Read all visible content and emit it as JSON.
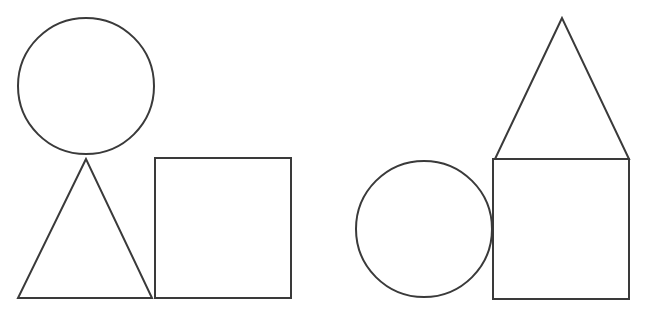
{
  "colors": {
    "background": "#ffffff",
    "stroke": "#3a3a3a"
  },
  "stroke_width": 2,
  "groups": [
    {
      "name": "left-arrangement",
      "circle": {
        "cx": 86,
        "cy": 86,
        "r": 68
      },
      "triangle": {
        "points": "86,159 18,298 152,298"
      },
      "square": {
        "x": 155,
        "y": 158,
        "w": 136,
        "h": 140
      }
    },
    {
      "name": "right-arrangement",
      "circle": {
        "cx": 424,
        "cy": 229,
        "r": 68
      },
      "triangle": {
        "points": "562,18 495,159 629,159"
      },
      "square": {
        "x": 493,
        "y": 159,
        "w": 136,
        "h": 140
      }
    }
  ]
}
